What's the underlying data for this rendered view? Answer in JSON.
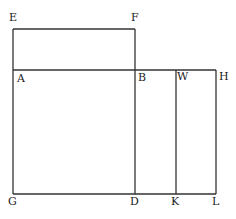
{
  "diagram": {
    "type": "geometric-figure",
    "stroke_color": "#333333",
    "background": "#ffffff",
    "points": {
      "E": {
        "label": "E",
        "x": 13,
        "y": 29
      },
      "F": {
        "label": "F",
        "x": 135,
        "y": 29
      },
      "A": {
        "label": "A",
        "x": 13,
        "y": 70
      },
      "B": {
        "label": "B",
        "x": 135,
        "y": 70
      },
      "W": {
        "label": "W",
        "x": 176,
        "y": 70
      },
      "H": {
        "label": "H",
        "x": 216,
        "y": 70
      },
      "G": {
        "label": "G",
        "x": 13,
        "y": 194
      },
      "D": {
        "label": "D",
        "x": 135,
        "y": 194
      },
      "K": {
        "label": "K",
        "x": 176,
        "y": 194
      },
      "L": {
        "label": "L",
        "x": 216,
        "y": 194
      }
    },
    "segments": [
      [
        "E",
        "F"
      ],
      [
        "E",
        "G"
      ],
      [
        "F",
        "D"
      ],
      [
        "A",
        "H"
      ],
      [
        "G",
        "L"
      ],
      [
        "W",
        "K"
      ],
      [
        "H",
        "L"
      ]
    ],
    "labels": [
      {
        "text": "E",
        "x": 9,
        "y": 21
      },
      {
        "text": "F",
        "x": 131,
        "y": 21
      },
      {
        "text": "A",
        "x": 17,
        "y": 82
      },
      {
        "text": "B",
        "x": 138,
        "y": 81
      },
      {
        "text": "W",
        "x": 177,
        "y": 80
      },
      {
        "text": "H",
        "x": 219,
        "y": 80
      },
      {
        "text": "G",
        "x": 8,
        "y": 205
      },
      {
        "text": "D",
        "x": 130,
        "y": 205
      },
      {
        "text": "K",
        "x": 171,
        "y": 205
      },
      {
        "text": "L",
        "x": 212,
        "y": 205
      }
    ]
  }
}
